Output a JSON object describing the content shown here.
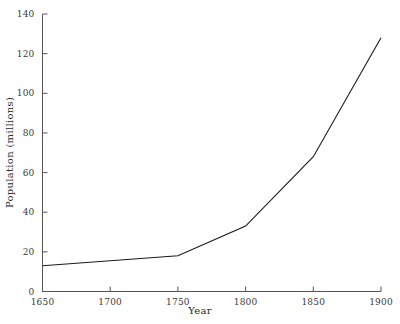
{
  "chart_data": {
    "type": "line",
    "title": "",
    "xlabel": "Year",
    "ylabel": "Population (millions)",
    "x": [
      1650,
      1750,
      1800,
      1850,
      1900
    ],
    "values": [
      13,
      18,
      33,
      68,
      128
    ],
    "series": [
      {
        "name": "Population",
        "values": [
          13,
          18,
          33,
          68,
          128
        ],
        "color": "#1a1a1a"
      }
    ],
    "xlim": [
      1650,
      1900
    ],
    "ylim": [
      0,
      140
    ],
    "xticks": [
      1650,
      1700,
      1750,
      1800,
      1850,
      1900
    ],
    "yticks": [
      0,
      20,
      40,
      60,
      80,
      100,
      120,
      140
    ],
    "xtick_labels": [
      "1650",
      "1700",
      "1750",
      "1800",
      "1850",
      "1900"
    ],
    "ytick_labels": [
      "0",
      "20",
      "40",
      "60",
      "80",
      "100",
      "120",
      "140"
    ],
    "grid": false,
    "legend": false,
    "legend_position": "none",
    "line_color": "#1a1a1a",
    "axis_color": "#555555",
    "background": "#ffffff"
  },
  "axes": {
    "x_axis_label": "Year",
    "y_axis_label": "Population (millions)"
  }
}
